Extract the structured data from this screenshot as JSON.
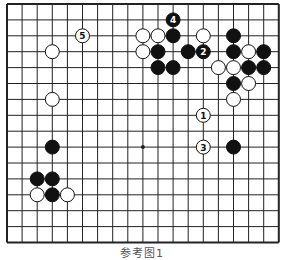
{
  "diagram": {
    "type": "go-board",
    "columns": 19,
    "rows_visible": 16,
    "origin": {
      "x": 7,
      "y": 4
    },
    "spacing": {
      "x": 15.1,
      "y": 15.9
    },
    "hoshi": [
      [
        9,
        9
      ]
    ],
    "colors": {
      "line": "#222222",
      "black": "#111111",
      "white": "#ffffff",
      "border": "#222222"
    },
    "stones": [
      {
        "c": 5,
        "r": 2,
        "color": "white",
        "label": "5"
      },
      {
        "c": 3,
        "r": 3,
        "color": "white",
        "label": ""
      },
      {
        "c": 3,
        "r": 6,
        "color": "white",
        "label": ""
      },
      {
        "c": 11,
        "r": 1,
        "color": "black",
        "label": "4"
      },
      {
        "c": 9,
        "r": 2,
        "color": "white",
        "label": ""
      },
      {
        "c": 10,
        "r": 2,
        "color": "white",
        "label": ""
      },
      {
        "c": 11,
        "r": 2,
        "color": "black",
        "label": ""
      },
      {
        "c": 13,
        "r": 2,
        "color": "white",
        "label": ""
      },
      {
        "c": 15,
        "r": 2,
        "color": "black",
        "label": ""
      },
      {
        "c": 9,
        "r": 3,
        "color": "white",
        "label": ""
      },
      {
        "c": 10,
        "r": 3,
        "color": "black",
        "label": ""
      },
      {
        "c": 12,
        "r": 3,
        "color": "black",
        "label": ""
      },
      {
        "c": 13,
        "r": 3,
        "color": "black",
        "label": "2"
      },
      {
        "c": 15,
        "r": 3,
        "color": "black",
        "label": ""
      },
      {
        "c": 16,
        "r": 3,
        "color": "white",
        "label": ""
      },
      {
        "c": 17,
        "r": 3,
        "color": "black",
        "label": ""
      },
      {
        "c": 10,
        "r": 4,
        "color": "black",
        "label": ""
      },
      {
        "c": 11,
        "r": 4,
        "color": "black",
        "label": ""
      },
      {
        "c": 14,
        "r": 4,
        "color": "white",
        "label": ""
      },
      {
        "c": 15,
        "r": 4,
        "color": "white",
        "label": ""
      },
      {
        "c": 16,
        "r": 4,
        "color": "black",
        "label": ""
      },
      {
        "c": 17,
        "r": 4,
        "color": "black",
        "label": ""
      },
      {
        "c": 15,
        "r": 5,
        "color": "black",
        "label": ""
      },
      {
        "c": 16,
        "r": 5,
        "color": "white",
        "label": ""
      },
      {
        "c": 15,
        "r": 6,
        "color": "white",
        "label": ""
      },
      {
        "c": 13,
        "r": 7,
        "color": "white",
        "label": "1"
      },
      {
        "c": 13,
        "r": 9,
        "color": "white",
        "label": "3"
      },
      {
        "c": 15,
        "r": 9,
        "color": "black",
        "label": ""
      },
      {
        "c": 3,
        "r": 9,
        "color": "black",
        "label": ""
      },
      {
        "c": 2,
        "r": 11,
        "color": "black",
        "label": ""
      },
      {
        "c": 3,
        "r": 11,
        "color": "black",
        "label": ""
      },
      {
        "c": 2,
        "r": 12,
        "color": "white",
        "label": ""
      },
      {
        "c": 3,
        "r": 12,
        "color": "black",
        "label": ""
      },
      {
        "c": 4,
        "r": 12,
        "color": "white",
        "label": ""
      }
    ],
    "caption": "参考图1"
  }
}
